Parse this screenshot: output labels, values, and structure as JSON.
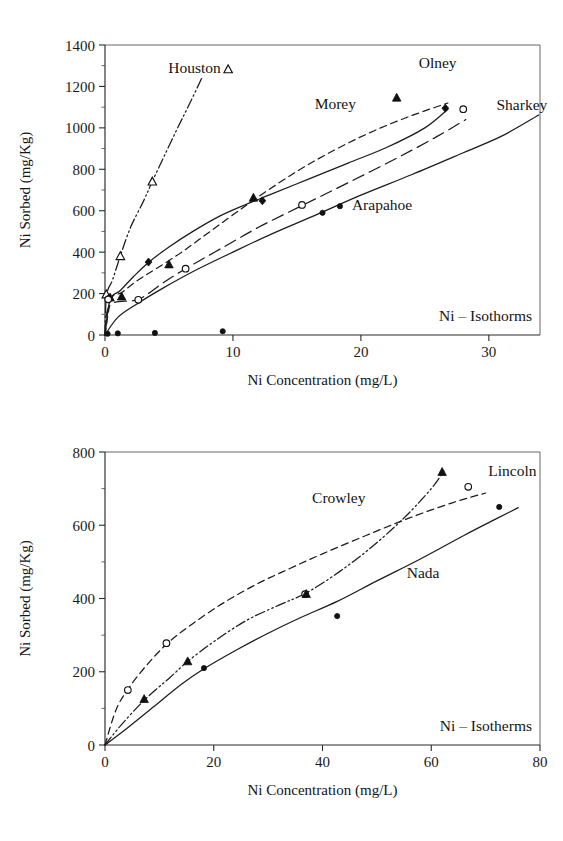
{
  "document": {
    "kind": "two-panel-scientific-figure",
    "background_color": "#ffffff",
    "ink_color": "#1a1a1a"
  },
  "chart_data": [
    {
      "id": "top",
      "type": "scatter",
      "title": "",
      "annotation": "Ni – Isothorms",
      "xlabel": "Ni Concentration (mg/L)",
      "ylabel": "Ni Sorbed (mg/Kg)",
      "xlim": [
        0,
        34
      ],
      "ylim": [
        0,
        1400
      ],
      "xticks": [
        0,
        10,
        20,
        30
      ],
      "yticks": [
        0,
        200,
        400,
        600,
        800,
        1000,
        1200,
        1400
      ],
      "grid": false,
      "legend_position": "inline-annotations",
      "series": [
        {
          "name": "Houston",
          "marker": "open-triangle",
          "line_style": "dashdotdot",
          "label_x": 7.0,
          "label_y": 1265,
          "label_anchor": "middle",
          "label_marker": "open-triangle",
          "points": [
            [
              0.1,
              195
            ],
            [
              1.2,
              380
            ],
            [
              3.7,
              740
            ]
          ],
          "curve": [
            [
              0.0,
              0
            ],
            [
              0.12,
              190
            ],
            [
              0.6,
              268
            ],
            [
              1.2,
              382
            ],
            [
              2.0,
              520
            ],
            [
              3.0,
              645
            ],
            [
              3.7,
              742
            ],
            [
              4.6,
              860
            ],
            [
              5.6,
              990
            ],
            [
              6.6,
              1115
            ],
            [
              7.6,
              1245
            ]
          ]
        },
        {
          "name": "Morey",
          "marker": "filled-triangle",
          "line_style": "dashed",
          "label_x": 18.0,
          "label_y": 1090,
          "label_anchor": "middle",
          "points": [
            [
              0.4,
              180
            ],
            [
              1.3,
              185
            ],
            [
              5.0,
              340
            ],
            [
              11.6,
              662
            ],
            [
              22.8,
              1145
            ]
          ],
          "curve": [
            [
              0.0,
              0
            ],
            [
              0.5,
              175
            ],
            [
              1.3,
              205
            ],
            [
              2.5,
              262
            ],
            [
              4.0,
              320
            ],
            [
              6.0,
              400
            ],
            [
              8.0,
              490
            ],
            [
              10.0,
              580
            ],
            [
              12.0,
              668
            ],
            [
              15.0,
              790
            ],
            [
              18.0,
              895
            ],
            [
              21.0,
              985
            ],
            [
              24.0,
              1060
            ],
            [
              26.8,
              1120
            ]
          ]
        },
        {
          "name": "Olney",
          "marker": "filled-diamond",
          "line_style": "solid",
          "label_x": 26.0,
          "label_y": 1290,
          "label_anchor": "middle",
          "points": [
            [
              0.3,
              178
            ],
            [
              3.4,
              352
            ],
            [
              12.3,
              648
            ],
            [
              26.6,
              1095
            ]
          ],
          "curve": [
            [
              0.0,
              0
            ],
            [
              0.4,
              170
            ],
            [
              1.2,
              215
            ],
            [
              2.2,
              280
            ],
            [
              3.4,
              350
            ],
            [
              5.0,
              425
            ],
            [
              7.0,
              505
            ],
            [
              9.0,
              575
            ],
            [
              11.0,
              630
            ],
            [
              13.0,
              680
            ],
            [
              16.0,
              755
            ],
            [
              19.0,
              830
            ],
            [
              22.0,
              905
            ],
            [
              25.0,
              1000
            ],
            [
              26.8,
              1090
            ]
          ]
        },
        {
          "name": "Sharkey",
          "marker": "open-circle",
          "line_style": "longdash",
          "label_x": 30.6,
          "label_y": 1085,
          "label_anchor": "start",
          "points": [
            [
              0.25,
              172
            ],
            [
              2.6,
              170
            ],
            [
              6.3,
              320
            ],
            [
              15.4,
              628
            ],
            [
              28.0,
              1090
            ]
          ],
          "curve": [
            [
              0.0,
              0
            ],
            [
              0.4,
              145
            ],
            [
              2.6,
              172
            ],
            [
              4.5,
              250
            ],
            [
              6.3,
              320
            ],
            [
              9.0,
              415
            ],
            [
              12.0,
              520
            ],
            [
              15.4,
              625
            ],
            [
              19.0,
              735
            ],
            [
              23.0,
              860
            ],
            [
              26.0,
              960
            ],
            [
              28.2,
              1040
            ]
          ]
        },
        {
          "name": "Arapahoe",
          "marker": "filled-circle",
          "line_style": "solid",
          "label_x": 19.3,
          "label_y": 605,
          "label_anchor": "start",
          "label_marker": "filled-circle",
          "points": [
            [
              0.2,
              6
            ],
            [
              1.0,
              8
            ],
            [
              3.9,
              10
            ],
            [
              9.2,
              18
            ],
            [
              17.0,
              590
            ]
          ],
          "curve": [
            [
              0.0,
              0
            ],
            [
              1.0,
              85
            ],
            [
              2.5,
              150
            ],
            [
              4.5,
              225
            ],
            [
              7.0,
              310
            ],
            [
              10.0,
              400
            ],
            [
              13.0,
              487
            ],
            [
              16.5,
              580
            ],
            [
              20.0,
              675
            ],
            [
              24.0,
              775
            ],
            [
              28.0,
              880
            ],
            [
              31.0,
              960
            ],
            [
              33.9,
              1062
            ]
          ]
        }
      ],
      "baseline_points": {
        "comment": "low-lying filled circles on the zero line",
        "values": [
          [
            0.2,
            6
          ],
          [
            1.0,
            8
          ],
          [
            3.9,
            10
          ],
          [
            9.2,
            18
          ]
        ]
      }
    },
    {
      "id": "bottom",
      "type": "scatter",
      "title": "",
      "annotation": "Ni – Isotherms",
      "xlabel": "Ni Concentration (mg/L)",
      "ylabel": "Ni Sorbed (mg/Kg)",
      "xlim": [
        0,
        80
      ],
      "ylim": [
        0,
        800
      ],
      "xticks": [
        0,
        20,
        40,
        60,
        80
      ],
      "yticks": [
        0,
        200,
        400,
        600,
        800
      ],
      "grid": false,
      "legend_position": "inline-annotations",
      "series": [
        {
          "name": "Lincoln",
          "marker": "open-circle",
          "line_style": "dashed",
          "label_x": 70.5,
          "label_y": 735,
          "label_anchor": "start",
          "points": [
            [
              4.2,
              150
            ],
            [
              11.3,
              278
            ],
            [
              36.8,
              412
            ],
            [
              66.8,
              705
            ]
          ],
          "curve": [
            [
              0.0,
              0
            ],
            [
              2.0,
              95
            ],
            [
              4.2,
              152
            ],
            [
              7.5,
              215
            ],
            [
              11.3,
              275
            ],
            [
              16.0,
              330
            ],
            [
              22.0,
              390
            ],
            [
              28.0,
              440
            ],
            [
              34.0,
              482
            ],
            [
              40.0,
              522
            ],
            [
              48.0,
              572
            ],
            [
              56.0,
              620
            ],
            [
              64.0,
              662
            ],
            [
              70.0,
              688
            ]
          ]
        },
        {
          "name": "Crowley",
          "marker": "filled-triangle",
          "line_style": "dashdotdot",
          "label_x": 43.0,
          "label_y": 660,
          "label_anchor": "middle",
          "points": [
            [
              7.2,
              125
            ],
            [
              15.2,
              228
            ],
            [
              37.0,
              412
            ],
            [
              62.0,
              745
            ]
          ],
          "curve": [
            [
              0.0,
              0
            ],
            [
              3.0,
              55
            ],
            [
              7.2,
              122
            ],
            [
              12.0,
              185
            ],
            [
              15.2,
              228
            ],
            [
              20.0,
              282
            ],
            [
              26.0,
              340
            ],
            [
              32.0,
              382
            ],
            [
              37.0,
              415
            ],
            [
              43.0,
              472
            ],
            [
              49.0,
              540
            ],
            [
              55.0,
              620
            ],
            [
              60.0,
              700
            ],
            [
              62.3,
              748
            ]
          ]
        },
        {
          "name": "Nada",
          "marker": "filled-circle",
          "line_style": "solid",
          "label_x": 58.5,
          "label_y": 455,
          "label_anchor": "middle",
          "points": [
            [
              18.2,
              210
            ],
            [
              42.7,
              352
            ],
            [
              72.5,
              650
            ]
          ],
          "curve": [
            [
              0.0,
              0
            ],
            [
              4.0,
              45
            ],
            [
              9.0,
              105
            ],
            [
              14.0,
              165
            ],
            [
              18.2,
              208
            ],
            [
              24.0,
              258
            ],
            [
              30.0,
              305
            ],
            [
              36.0,
              348
            ],
            [
              42.7,
              392
            ],
            [
              50.0,
              448
            ],
            [
              58.0,
              508
            ],
            [
              66.0,
              572
            ],
            [
              72.0,
              618
            ],
            [
              76.0,
              648
            ]
          ]
        }
      ]
    }
  ]
}
